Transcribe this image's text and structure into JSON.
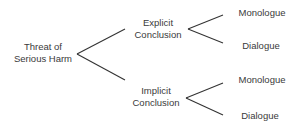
{
  "tree": {
    "root": {
      "line1": "Threat of",
      "line2": "Serious Harm"
    },
    "branches": [
      {
        "line1": "Explicit",
        "line2": "Conclusion",
        "leaves": [
          "Monologue",
          "Dialogue"
        ]
      },
      {
        "line1": "Implicit",
        "line2": "Conclusion",
        "leaves": [
          "Monologue",
          "Dialogue"
        ]
      }
    ]
  }
}
